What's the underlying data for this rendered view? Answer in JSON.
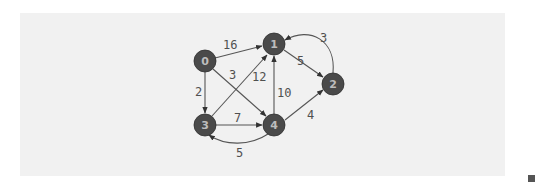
{
  "figure": {
    "background": "#f1f1f1",
    "node_color": "#4a4a4a",
    "node_label_color": "#bdbdbd",
    "edge_color": "#555555",
    "nodes": [
      {
        "id": "0",
        "label": "0",
        "x": 205,
        "y": 61
      },
      {
        "id": "1",
        "label": "1",
        "x": 274,
        "y": 44
      },
      {
        "id": "2",
        "label": "2",
        "x": 333,
        "y": 84
      },
      {
        "id": "3",
        "label": "3",
        "x": 205,
        "y": 125
      },
      {
        "id": "4",
        "label": "4",
        "x": 274,
        "y": 125
      }
    ],
    "edges": [
      {
        "from": "0",
        "to": "1",
        "weight": "16"
      },
      {
        "from": "0",
        "to": "3",
        "weight": "2"
      },
      {
        "from": "0",
        "to": "4",
        "weight": "3"
      },
      {
        "from": "3",
        "to": "1",
        "weight": "12"
      },
      {
        "from": "4",
        "to": "1",
        "weight": "10"
      },
      {
        "from": "3",
        "to": "4",
        "weight": "7"
      },
      {
        "from": "1",
        "to": "2",
        "weight": "5"
      },
      {
        "from": "2",
        "to": "1",
        "weight": "3"
      },
      {
        "from": "4",
        "to": "2",
        "weight": "4"
      },
      {
        "from": "4",
        "to": "3",
        "weight": "5"
      }
    ]
  }
}
